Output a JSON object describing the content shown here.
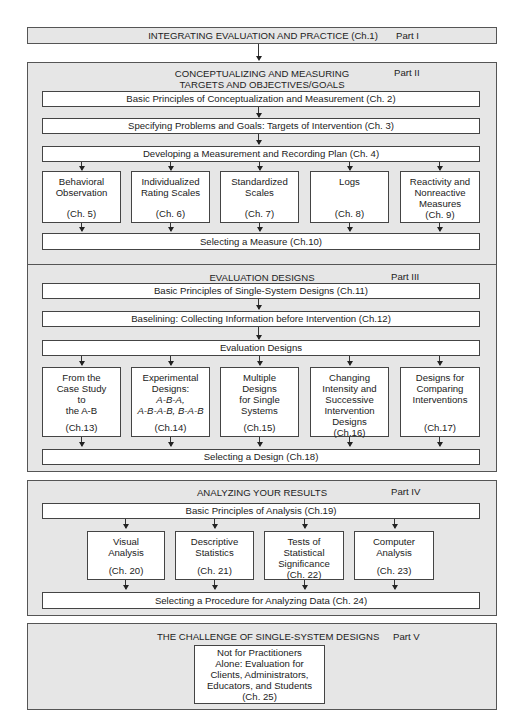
{
  "parts": [
    {
      "title": "INTEGRATING EVALUATION AND PRACTICE (Ch.1)",
      "label": "Part I"
    },
    {
      "title_line1": "CONCEPTUALIZING AND MEASURING",
      "title_line2": "TARGETS AND OBJECTIVES/GOALS",
      "label": "Part II",
      "boxes": [
        "Basic Principles of Conceptualization and Measurement (Ch. 2)",
        "Specifying Problems and Goals: Targets of Intervention (Ch. 3)",
        "Developing a Measurement and Recording Plan (Ch. 4)"
      ],
      "columns": [
        {
          "lines": [
            "Behavioral",
            "Observation"
          ],
          "chapter": "(Ch. 5)"
        },
        {
          "lines": [
            "Individualized",
            "Rating Scales"
          ],
          "chapter": "(Ch. 6)"
        },
        {
          "lines": [
            "Standardized",
            "Scales"
          ],
          "chapter": "(Ch. 7)"
        },
        {
          "lines": [
            "Logs"
          ],
          "chapter": "(Ch. 8)"
        },
        {
          "lines": [
            "Reactivity and",
            "Nonreactive",
            "Measures"
          ],
          "chapter": "(Ch. 9)"
        }
      ],
      "footer": "Selecting a Measure (Ch.10)"
    },
    {
      "title": "EVALUATION DESIGNS",
      "label": "Part III",
      "boxes": [
        "Basic Principles of Single-System Designs (Ch.11)",
        "Baselining: Collecting Information before Intervention (Ch.12)",
        "Evaluation Designs"
      ],
      "columns": [
        {
          "lines": [
            "From the",
            "Case Study",
            "to",
            "the A-B"
          ],
          "chapter": "(Ch.13)"
        },
        {
          "lines": [
            "Experimental",
            "Designs:",
            "A-B-A,",
            "A-B-A-B, B-A-B"
          ],
          "chapter": "(Ch.14)"
        },
        {
          "lines": [
            "Multiple",
            "Designs",
            "for Single",
            "Systems"
          ],
          "chapter": "(Ch.15)"
        },
        {
          "lines": [
            "Changing",
            "Intensity and",
            "Successive",
            "Intervention",
            "Designs"
          ],
          "chapter": "(Ch.16)"
        },
        {
          "lines": [
            "Designs for",
            "Comparing",
            "Interventions"
          ],
          "chapter": "(Ch.17)"
        }
      ],
      "footer": "Selecting a Design (Ch.18)"
    },
    {
      "title": "ANALYZING YOUR RESULTS",
      "label": "Part IV",
      "boxes": [
        "Basic Principles of Analysis (Ch.19)"
      ],
      "columns": [
        {
          "lines": [
            "Visual",
            "Analysis"
          ],
          "chapter": "(Ch. 20)"
        },
        {
          "lines": [
            "Descriptive",
            "Statistics"
          ],
          "chapter": "(Ch. 21)"
        },
        {
          "lines": [
            "Tests of",
            "Statistical",
            "Significance"
          ],
          "chapter": "(Ch. 22)"
        },
        {
          "lines": [
            "Computer",
            "Analysis"
          ],
          "chapter": "(Ch. 23)"
        }
      ],
      "footer": "Selecting a Procedure for Analyzing Data (Ch. 24)"
    },
    {
      "title": "THE CHALLENGE OF SINGLE-SYSTEM DESIGNS",
      "label": "Part V",
      "box_lines": [
        "Not for Practitioners",
        "Alone: Evaluation for",
        "Clients, Administrators,",
        "Educators, and Students",
        "(Ch. 25)"
      ]
    }
  ]
}
